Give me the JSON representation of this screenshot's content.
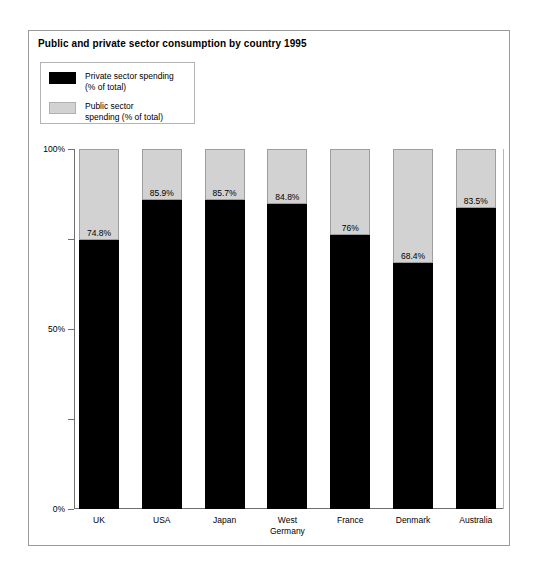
{
  "chart_data": {
    "type": "bar",
    "subtype": "stacked-100-percent",
    "title": "Public and private sector consumption by country 1995",
    "xlabel": "",
    "ylabel": "",
    "ylim": [
      0,
      100
    ],
    "y_ticks": [
      {
        "value": 100,
        "label": "100%",
        "major": true
      },
      {
        "value": 75,
        "label": "",
        "major": false
      },
      {
        "value": 50,
        "label": "50%",
        "major": true
      },
      {
        "value": 25,
        "label": "",
        "major": false
      },
      {
        "value": 0,
        "label": "0%",
        "major": true
      }
    ],
    "grid": false,
    "legend_position": "top-left",
    "categories": [
      "UK",
      "USA",
      "Japan",
      "West Germany",
      "France",
      "Denmark",
      "Australia"
    ],
    "category_lines": [
      [
        "UK"
      ],
      [
        "USA"
      ],
      [
        "Japan"
      ],
      [
        "West",
        "Germany"
      ],
      [
        "France"
      ],
      [
        "Denmark"
      ],
      [
        "Australia"
      ]
    ],
    "series": [
      {
        "name": "Private sector spending (% of total)",
        "color": "#000000",
        "values": [
          74.8,
          85.9,
          85.7,
          84.8,
          76,
          68.4,
          83.5
        ],
        "labels": [
          "74.8%",
          "85.9%",
          "85.7%",
          "84.8%",
          "76%",
          "68.4%",
          "83.5%"
        ]
      },
      {
        "name": "Public sector spending (% of total)",
        "color": "#d2d2d2",
        "values": [
          25.2,
          14.1,
          14.3,
          15.2,
          24,
          31.6,
          16.5
        ],
        "labels": [
          "",
          "",
          "",
          "",
          "",
          "",
          ""
        ]
      }
    ]
  },
  "legend": {
    "items": [
      {
        "swatch": "private",
        "line1": "Private sector spending",
        "line2": "(% of total)"
      },
      {
        "swatch": "public",
        "line1": "Public sector",
        "line2": "spending (% of total)"
      }
    ]
  },
  "colors": {
    "private": "#000000",
    "public": "#d2d2d2",
    "axis": "#6f6f6f",
    "border": "#9a9a9a",
    "text": "#000000"
  }
}
